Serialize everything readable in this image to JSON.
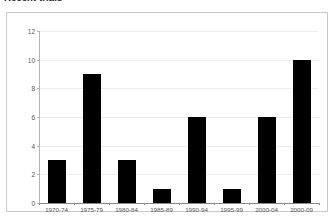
{
  "figure": {
    "title": "Recent trials",
    "frame_border_color": "#c9c9c9",
    "background": "#ffffff"
  },
  "chart_data": {
    "type": "bar",
    "title": "Recent trials",
    "xlabel": "",
    "ylabel": "",
    "categories": [
      "1970-74",
      "1975-79",
      "1980-84",
      "1985-89",
      "1990-94",
      "1995-99",
      "2000-04",
      "2000-09"
    ],
    "values": [
      3,
      9,
      3,
      1,
      6,
      1,
      6,
      10
    ],
    "ylim": [
      0,
      12
    ],
    "yticks": [
      0,
      2,
      4,
      6,
      8,
      10,
      12
    ],
    "ytick_labels": [
      "0",
      "2",
      "4",
      "6",
      "8",
      "10",
      "12"
    ],
    "grid": true,
    "grid_axis": "y",
    "grid_color": "#ededed",
    "bar_color": "#000000",
    "bar_count": 8,
    "legend": null,
    "legend_position": "none",
    "annotations": []
  },
  "axes": {
    "y_axis_color": "#b4b4b4",
    "x_axis_color": "#8a8a8a",
    "tick_label_color": "#555555"
  }
}
